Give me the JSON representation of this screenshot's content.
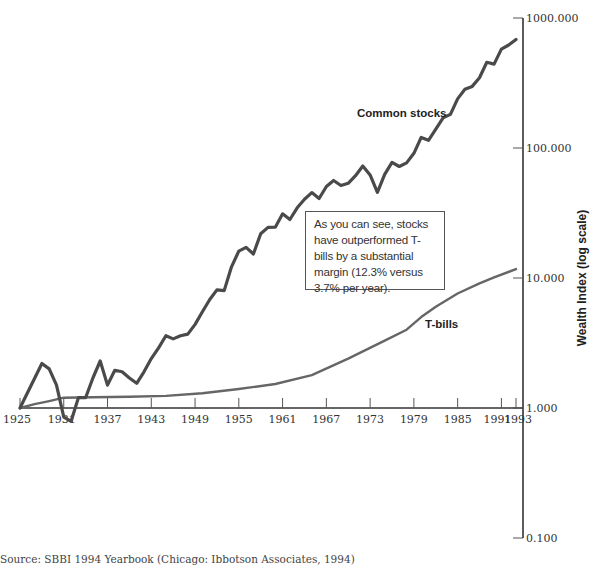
{
  "chart_data": {
    "type": "line",
    "title": "",
    "xlabel": "",
    "ylabel": "Wealth Index (log scale)",
    "yscale": "log",
    "ylim": [
      0.1,
      1000
    ],
    "xlim": [
      1925,
      1993
    ],
    "grid": false,
    "legend": "inline labels",
    "x_ticks": [
      "1925",
      "1931",
      "1937",
      "1943",
      "1949",
      "1955",
      "1961",
      "1967",
      "1973",
      "1979",
      "1985",
      "1991",
      "1993"
    ],
    "y_ticks": [
      "1000.000",
      "100.000",
      "10.000",
      "1.000",
      "0.100"
    ],
    "series": [
      {
        "name": "Common stocks",
        "color": "#4a4a4a",
        "x": [
          1925,
          1928,
          1929,
          1930,
          1931,
          1932,
          1933,
          1934,
          1935,
          1936,
          1937,
          1938,
          1939,
          1940,
          1941,
          1942,
          1943,
          1944,
          1945,
          1946,
          1947,
          1948,
          1949,
          1950,
          1951,
          1952,
          1953,
          1954,
          1955,
          1956,
          1957,
          1958,
          1959,
          1960,
          1961,
          1962,
          1963,
          1964,
          1965,
          1966,
          1967,
          1968,
          1969,
          1970,
          1971,
          1972,
          1973,
          1974,
          1975,
          1976,
          1977,
          1978,
          1979,
          1980,
          1981,
          1982,
          1983,
          1984,
          1985,
          1986,
          1987,
          1988,
          1989,
          1990,
          1991,
          1992,
          1993
        ],
        "values": [
          1.0,
          2.2,
          2.0,
          1.5,
          0.85,
          0.79,
          1.2,
          1.2,
          1.7,
          2.3,
          1.5,
          1.95,
          1.9,
          1.7,
          1.55,
          1.9,
          2.4,
          2.9,
          3.6,
          3.4,
          3.6,
          3.7,
          4.4,
          5.5,
          6.8,
          8.1,
          8.0,
          12.2,
          16.1,
          17.2,
          15.3,
          21.9,
          24.5,
          24.6,
          31.2,
          28.2,
          34.7,
          40.4,
          45.4,
          40.9,
          50.6,
          56.2,
          51.5,
          53.5,
          61.2,
          72.7,
          62.1,
          45.6,
          62.7,
          77.6,
          72.0,
          76.8,
          91.1,
          120.6,
          114.7,
          139.4,
          170.7,
          181.4,
          238.5,
          283.0,
          297.7,
          347.4,
          456.3,
          441.6,
          576.5,
          620.4,
          682.8
        ]
      },
      {
        "name": "T-bills",
        "color": "#666666",
        "x": [
          1925,
          1927,
          1929,
          1931,
          1935,
          1940,
          1945,
          1950,
          1955,
          1960,
          1965,
          1970,
          1975,
          1978,
          1980,
          1982,
          1985,
          1988,
          1990,
          1993
        ],
        "values": [
          1.0,
          1.07,
          1.13,
          1.2,
          1.21,
          1.22,
          1.24,
          1.3,
          1.4,
          1.53,
          1.79,
          2.4,
          3.3,
          4.0,
          5.0,
          6.0,
          7.6,
          9.1,
          10.1,
          11.7
        ]
      }
    ],
    "annotations": [
      "As you can see, stocks have outperformed T-bills by a substantial margin (12.3% versus 3.7% per year)."
    ]
  },
  "labels": {
    "stocks": "Common stocks",
    "tbills": "T-bills",
    "ylabel": "Wealth Index (log scale)"
  },
  "note": {
    "text": "As you can see, stocks have outperformed T-bills by a substantial margin (12.3% versus 3.7% per year)."
  },
  "source": {
    "text": "Source: SBBI 1994 Yearbook (Chicago: Ibbotson Associates, 1994)"
  }
}
